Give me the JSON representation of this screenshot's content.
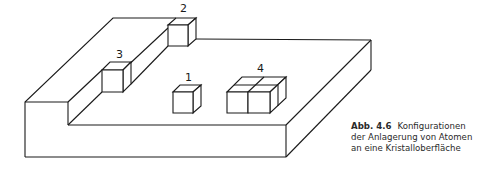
{
  "figure": {
    "labels": {
      "site_1": "1",
      "site_2": "2",
      "site_3": "3",
      "site_4": "4"
    }
  },
  "caption": {
    "number": "Abb. 4.6",
    "line1": "Konfigurationen",
    "line2": "der Anlagerung von Atomen",
    "line3": "an eine Kristalloberfläche"
  }
}
